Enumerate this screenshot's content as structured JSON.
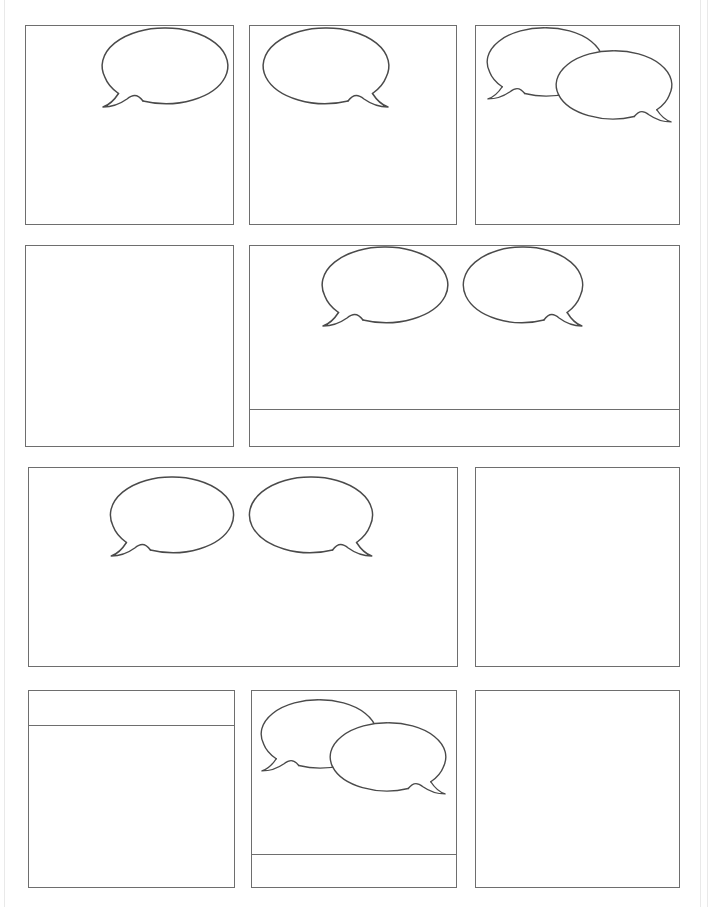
{
  "document": {
    "kind": "comic-page-template",
    "title": "Blank Comic Book Page Template",
    "page_width": 713,
    "page_height": 907,
    "background_color": "#ffffff",
    "panel_border_color": "#6e6e6e",
    "balloon_stroke_color": "#4a4a4a",
    "balloon_fill_color": "#ffffff",
    "panel_border_width": 1.6,
    "rows": 4,
    "panel_count": 9
  },
  "rows": [
    {
      "index": 1,
      "top": 25,
      "height": 200,
      "panels": [
        {
          "id": "panel-1",
          "x": 25,
          "y": 25,
          "w": 209,
          "h": 200,
          "caption_box": null,
          "balloons": [
            {
              "type": "speech-balloon",
              "tail": "bottom-left",
              "cx": 165,
              "cy": 66,
              "rx": 62,
              "ry": 38
            }
          ]
        },
        {
          "id": "panel-2",
          "x": 249,
          "y": 25,
          "w": 208,
          "h": 200,
          "caption_box": null,
          "balloons": [
            {
              "type": "speech-balloon",
              "tail": "bottom-right",
              "cx": 326,
              "cy": 66,
              "rx": 62,
              "ry": 38
            }
          ]
        },
        {
          "id": "panel-3",
          "x": 475,
          "y": 25,
          "w": 205,
          "h": 200,
          "caption_box": null,
          "balloons": [
            {
              "type": "speech-balloon",
              "tail": "bottom-left",
              "cx": 545,
              "cy": 62,
              "rx": 56,
              "ry": 34,
              "layer": "back"
            },
            {
              "type": "speech-balloon",
              "tail": "bottom-right",
              "cx": 613,
              "cy": 84,
              "rx": 56,
              "ry": 34,
              "layer": "front"
            }
          ]
        }
      ]
    },
    {
      "index": 2,
      "top": 245,
      "height": 202,
      "panels": [
        {
          "id": "panel-4",
          "x": 25,
          "y": 245,
          "w": 209,
          "h": 202,
          "caption_box": null,
          "balloons": [
            {
              "type": "thought-balloon",
              "orientation": "top-right-overflow",
              "trail_circles": 3
            }
          ]
        },
        {
          "id": "panel-5",
          "x": 249,
          "y": 245,
          "w": 431,
          "h": 202,
          "caption_box": {
            "position": "bottom",
            "height": 35
          },
          "balloons": [
            {
              "type": "speech-balloon",
              "tail": "bottom-left",
              "cx": 385,
              "cy": 285,
              "rx": 62,
              "ry": 38
            },
            {
              "type": "speech-balloon",
              "tail": "bottom-right",
              "cx": 523,
              "cy": 285,
              "rx": 58,
              "ry": 38
            }
          ]
        }
      ]
    },
    {
      "index": 3,
      "top": 467,
      "height": 200,
      "panels": [
        {
          "id": "panel-6",
          "x": 28,
          "y": 467,
          "w": 430,
          "h": 200,
          "caption_box": null,
          "balloons": [
            {
              "type": "speech-balloon",
              "tail": "bottom-left",
              "cx": 172,
              "cy": 515,
              "rx": 60,
              "ry": 38
            },
            {
              "type": "speech-balloon",
              "tail": "bottom-right",
              "cx": 310,
              "cy": 515,
              "rx": 60,
              "ry": 38
            }
          ]
        },
        {
          "id": "panel-7",
          "x": 475,
          "y": 467,
          "w": 205,
          "h": 200,
          "caption_box": null,
          "balloons": [
            {
              "type": "thought-balloon",
              "orientation": "top-left-overflow",
              "trail_circles": 3
            }
          ]
        }
      ]
    },
    {
      "index": 4,
      "top": 690,
      "height": 198,
      "panels": [
        {
          "id": "panel-8",
          "x": 28,
          "y": 690,
          "w": 207,
          "h": 198,
          "caption_box": {
            "position": "top",
            "height": 34
          },
          "balloons": []
        },
        {
          "id": "panel-9",
          "x": 251,
          "y": 690,
          "w": 206,
          "h": 198,
          "caption_box": {
            "position": "bottom",
            "height": 33
          },
          "balloons": [
            {
              "type": "speech-balloon",
              "tail": "bottom-left",
              "cx": 313,
              "cy": 735,
              "rx": 56,
              "ry": 34,
              "layer": "back"
            },
            {
              "type": "speech-balloon",
              "tail": "bottom-right",
              "cx": 381,
              "cy": 757,
              "rx": 56,
              "ry": 34,
              "layer": "front"
            }
          ]
        },
        {
          "id": "panel-10",
          "x": 475,
          "y": 690,
          "w": 205,
          "h": 198,
          "caption_box": null,
          "balloons": []
        }
      ]
    }
  ]
}
